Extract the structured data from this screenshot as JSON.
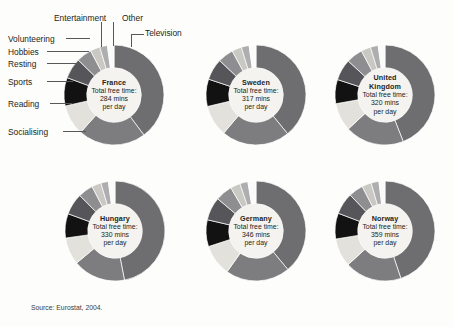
{
  "source_note": "Source: Eurostat, 2004.",
  "categories": [
    "Television",
    "Socialising",
    "Reading",
    "Sports",
    "Resting",
    "Hobbies",
    "Volunteering",
    "Entertainment",
    "Other"
  ],
  "colors": {
    "television": "#6e6e70",
    "socialising": "#7d7d7f",
    "reading": "#e2e1dc",
    "sports": "#121212",
    "resting": "#55555a",
    "hobbies": "#8e8e90",
    "volunteering": "#c9c8c3",
    "entertainment": "#aeaeb0",
    "other": "#fbfbf9",
    "hub_fill": "#f4f3f0",
    "leader_line": "#58585a",
    "text": "#231f20",
    "background": "#fdfdfb"
  },
  "labels": {
    "entertainment": "Entertainment",
    "other": "Other",
    "television": "Television",
    "volunteering": "Volunteering",
    "hobbies": "Hobbies",
    "resting": "Resting",
    "sports": "Sports",
    "reading": "Reading",
    "socialising": "Socialising"
  },
  "common": {
    "total_label": "Total free time:",
    "per_day": "per day",
    "mins_suffix": "mins"
  },
  "chart_data": {
    "type": "pie",
    "title": "",
    "subtype": "donut-small-multiples",
    "legend_position": "callout-labels-on-first-chart",
    "unit": "minutes per day",
    "categories": [
      "Television",
      "Socialising",
      "Reading",
      "Sports",
      "Resting",
      "Hobbies",
      "Volunteering",
      "Entertainment",
      "Other"
    ],
    "series": [
      {
        "name": "France",
        "total_mins": 284,
        "total_text": "284 mins",
        "values": [
          113,
          62,
          28,
          26,
          19,
          14,
          9,
          7,
          6
        ],
        "percents": [
          40,
          22,
          10,
          9,
          6,
          5,
          3,
          2,
          2
        ]
      },
      {
        "name": "Sweden",
        "total_mins": 317,
        "total_text": "317 mins",
        "values": [
          124,
          70,
          32,
          28,
          22,
          16,
          10,
          8,
          7
        ],
        "percents": [
          39,
          22,
          10,
          9,
          7,
          5,
          3,
          3,
          2
        ]
      },
      {
        "name": "United Kingdom",
        "total_mins": 320,
        "total_text": "320 mins",
        "values": [
          141,
          61,
          29,
          25,
          22,
          17,
          10,
          8,
          7
        ],
        "percents": [
          44,
          19,
          9,
          8,
          7,
          5,
          3,
          2,
          2
        ]
      },
      {
        "name": "Hungary",
        "total_mins": 330,
        "total_text": "330 mins",
        "values": [
          155,
          56,
          29,
          26,
          23,
          16,
          10,
          8,
          7
        ],
        "percents": [
          47,
          17,
          9,
          8,
          7,
          5,
          3,
          2,
          2
        ]
      },
      {
        "name": "Germany",
        "total_mins": 346,
        "total_text": "346 mins",
        "values": [
          135,
          72,
          35,
          30,
          26,
          19,
          11,
          9,
          9
        ],
        "percents": [
          39,
          21,
          10,
          9,
          7,
          5,
          3,
          3,
          3
        ]
      },
      {
        "name": "Norway",
        "total_mins": 359,
        "total_text": "359 mins",
        "values": [
          161,
          66,
          33,
          30,
          25,
          17,
          11,
          9,
          7
        ],
        "percents": [
          45,
          18,
          9,
          8,
          7,
          5,
          3,
          3,
          2
        ]
      }
    ]
  },
  "charts": [
    {
      "id": "france",
      "country": "France",
      "country_line2": "",
      "total_text": "284 mins",
      "cx": 114,
      "cy": 95,
      "r": 50,
      "values": [
        113,
        62,
        28,
        26,
        19,
        14,
        9,
        7,
        6
      ]
    },
    {
      "id": "sweden",
      "country": "Sweden",
      "country_line2": "",
      "total_text": "317 mins",
      "cx": 256,
      "cy": 95,
      "r": 50,
      "values": [
        124,
        70,
        32,
        28,
        22,
        16,
        10,
        8,
        7
      ]
    },
    {
      "id": "united-kingdom",
      "country": "United",
      "country_line2": "Kingdom",
      "total_text": "320 mins",
      "cx": 385,
      "cy": 95,
      "r": 50,
      "values": [
        141,
        61,
        29,
        25,
        22,
        17,
        10,
        8,
        7
      ]
    },
    {
      "id": "hungary",
      "country": "Hungary",
      "country_line2": "",
      "total_text": "330 mins",
      "cx": 115,
      "cy": 231,
      "r": 50,
      "values": [
        155,
        56,
        29,
        26,
        23,
        16,
        10,
        8,
        7
      ]
    },
    {
      "id": "germany",
      "country": "Germany",
      "country_line2": "",
      "total_text": "346 mins",
      "cx": 256,
      "cy": 231,
      "r": 50,
      "values": [
        135,
        72,
        35,
        30,
        26,
        19,
        11,
        9,
        9
      ]
    },
    {
      "id": "norway",
      "country": "Norway",
      "country_line2": "",
      "total_text": "359 mins",
      "cx": 385,
      "cy": 231,
      "r": 50,
      "values": [
        161,
        66,
        33,
        30,
        25,
        17,
        11,
        9,
        7
      ]
    }
  ]
}
